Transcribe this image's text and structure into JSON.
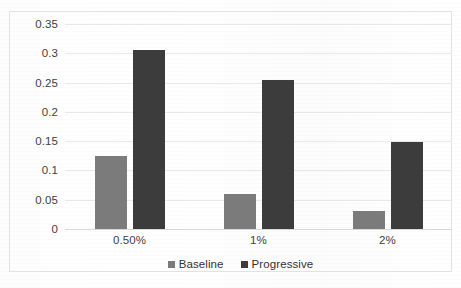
{
  "chart_data": {
    "type": "bar",
    "title": "",
    "subtitle": "",
    "xlabel": "",
    "ylabel": "",
    "categories": [
      "0.50%",
      "1%",
      "2%"
    ],
    "series": [
      {
        "name": "Baseline",
        "color": "#7b7b7b",
        "values": [
          0.125,
          0.06,
          0.031
        ]
      },
      {
        "name": "Progressive",
        "color": "#3c3c3c",
        "values": [
          0.305,
          0.255,
          0.148
        ]
      }
    ],
    "ylim": [
      0,
      0.35
    ],
    "yticks": [
      "0",
      "0.05",
      "0.1",
      "0.15",
      "0.2",
      "0.25",
      "0.3",
      "0.35"
    ],
    "ytick_values": [
      0,
      0.05,
      0.1,
      0.15,
      0.2,
      0.25,
      0.3,
      0.35
    ],
    "grid": true,
    "grid_axis": "y",
    "legend": true,
    "legend_position": "bottom",
    "annotations": []
  }
}
